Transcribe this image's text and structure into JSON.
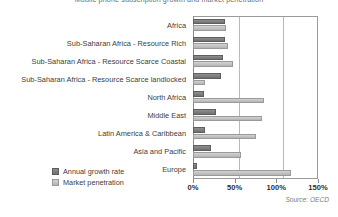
{
  "chart_data": {
    "type": "bar",
    "orientation": "horizontal",
    "title": "Mobile phone subscription growth and market penetration",
    "categories": [
      "Africa",
      "Sub-Saharan Africa - Resource Rich",
      "Sub-Saharan Africa - Resource Scarce Coastal",
      "Sub-Saharan Africa - Resource Scarce landlocked",
      "North Africa",
      "Middle East",
      "Latin America & Caribbean",
      "Asia and Pacific",
      "Europe"
    ],
    "series": [
      {
        "name": "Annual growth rate",
        "color": "#7a7a7a",
        "values": [
          38,
          38,
          36,
          33,
          13,
          27,
          14,
          22,
          5
        ]
      },
      {
        "name": "Market penetration",
        "color": "#c4c4c4",
        "values": [
          40,
          42,
          48,
          14,
          85,
          83,
          76,
          58,
          118
        ]
      }
    ],
    "xlabel": "",
    "ylabel": "",
    "xlim": [
      0,
      150
    ],
    "xticks": [
      0,
      50,
      100,
      150
    ],
    "xtick_labels": [
      "0%",
      "50%",
      "100%",
      "150%"
    ],
    "grid": true,
    "gridlines_at": [
      50,
      100
    ],
    "legend_position": "bottom-left",
    "source_note": "Source: OECD"
  },
  "legend": {
    "items": [
      {
        "label": "Annual growth rate",
        "swatch": "growth"
      },
      {
        "label": "Market penetration",
        "swatch": "penetration"
      }
    ]
  },
  "footer": {
    "source": "Source: OECD"
  }
}
